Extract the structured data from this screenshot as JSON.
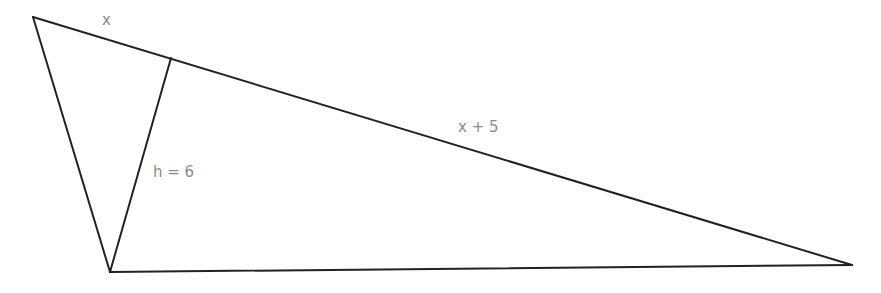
{
  "diagram": {
    "type": "triangle-with-altitude",
    "vertices": {
      "top_left": [
        33,
        17
      ],
      "bottom": [
        110,
        272
      ],
      "right": [
        852,
        265
      ]
    },
    "altitude_foot": [
      171,
      58
    ],
    "labels": {
      "segment_x": "x",
      "segment_x_plus_5": "x + 5",
      "height": "h = 6"
    },
    "colors": {
      "stroke": "#222222",
      "label": "#8a8a8a",
      "background": "#ffffff"
    }
  }
}
